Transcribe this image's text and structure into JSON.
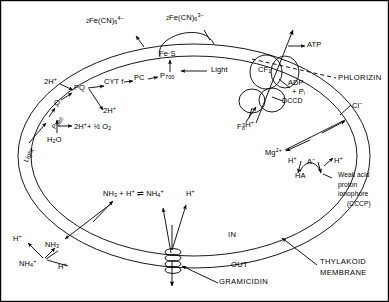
{
  "figure": {
    "type": "biological-schematic",
    "border_color": "#000000",
    "line_color": "#000000",
    "background": "#ffffff"
  },
  "compartments": {
    "inside_label": "IN",
    "outside_label": "OUT",
    "membrane_label_line1": "THYLAKOID",
    "membrane_label_line2": "MEMBRANE"
  },
  "electron_transport": {
    "light_psii": "Light",
    "p680": "P",
    "p680_sub": "680",
    "q": "Q",
    "pq": "PQ",
    "cytf": "CYT f",
    "pc": "PC",
    "p700": "P",
    "p700_sub": "700",
    "fes": "Fe·S",
    "light_psi": "Light",
    "protons_in": "2H",
    "protons_in_charge": "+",
    "protons_out": "2H",
    "protons_out_charge": "+",
    "water": "H",
    "water_sub": "2",
    "water_rest": "O",
    "water_split": "2H",
    "water_split_charge": "+",
    "water_split_rest": "+ ½ O",
    "water_split_rest_sub": "2"
  },
  "ferricyanide": {
    "reduced_prefix": "2",
    "reduced_formula": "Fe(CN)",
    "reduced_sub": "6",
    "reduced_sup": "4−",
    "oxidized_prefix": "2",
    "oxidized_formula": "Fe(CN)",
    "oxidized_sub": "6",
    "oxidized_sup": "3−"
  },
  "atp_synthase": {
    "cf1": "CF",
    "cf1_sub": "1",
    "f0": "F",
    "f0_sub": "o",
    "dccd": "DCCD",
    "atp": "ATP",
    "adp": "ADP",
    "pi": "+ P",
    "pi_sub": "i",
    "protons": "3H",
    "protons_charge": "+",
    "phlorizin": "PHLORIZIN"
  },
  "ion_transport": {
    "chloride": "Cl",
    "chloride_charge": "−",
    "magnesium": "Mg",
    "magnesium_charge": "2+"
  },
  "weak_acid_ionophore": {
    "proton_left": "H",
    "proton_left_charge": "+",
    "anion": "A",
    "anion_charge": "−",
    "proton_right": "H",
    "proton_right_charge": "+",
    "acid": "HA",
    "caption_line1": "Weak acid",
    "caption_line2": "proton",
    "caption_line3": "ionophore",
    "caption_line4": "(CCCP)"
  },
  "ammonia": {
    "equation_nh3": "NH",
    "equation_nh3_sub": "3",
    "equation_plus_h": "+ H",
    "equation_plus_h_charge": "+",
    "equation_arrows": "⇌",
    "equation_nh4": "NH",
    "equation_nh4_sub": "4",
    "equation_nh4_charge": "+",
    "inner_proton": "H",
    "inner_proton_charge": "+",
    "outer_proton": "H",
    "outer_proton_charge": "+",
    "outer_nh3": "NH",
    "outer_nh3_sub": "3",
    "outer_nh4": "NH",
    "outer_nh4_sub": "4",
    "outer_nh4_charge": "+"
  },
  "gramicidin": {
    "label": "GRAMICIDIN"
  }
}
